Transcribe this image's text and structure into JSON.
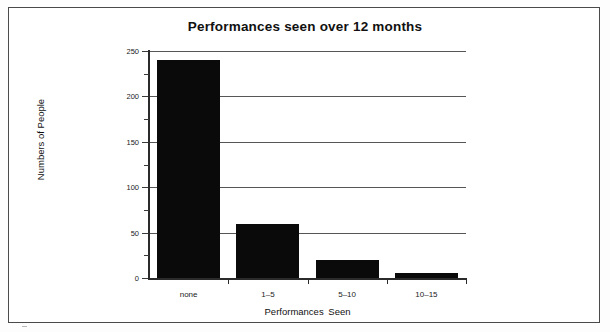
{
  "chart_data": {
    "type": "bar",
    "title": "Performances seen over 12 months",
    "xlabel": "Performances Seen",
    "ylabel": "Numbers of People",
    "categories": [
      "none",
      "1–5",
      "5–10",
      "10–15"
    ],
    "values": [
      240,
      60,
      20,
      6
    ],
    "series": [
      {
        "name": "Numbers of People",
        "values": [
          240,
          60,
          20,
          6
        ]
      }
    ],
    "ylim": [
      0,
      250
    ],
    "ytick_labels": [
      "0",
      "50",
      "100",
      "150",
      "200",
      "250"
    ],
    "ytick_values": [
      0,
      50,
      100,
      150,
      200,
      250
    ],
    "yminor_tick_values": [
      25,
      75,
      125,
      175,
      225
    ],
    "grid": "horizontal-major",
    "legend": "none",
    "bar_color": "#0a0a0a",
    "gridline_color": "#565656",
    "axis_color": "#2b2b2b",
    "background_color": "#ffffff"
  }
}
